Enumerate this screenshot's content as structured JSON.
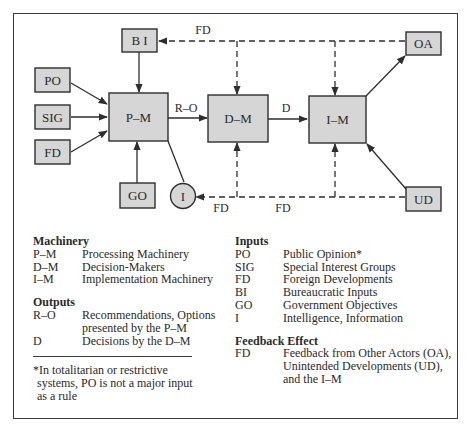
{
  "diagram": {
    "nodes": {
      "bi": "B I",
      "po": "PO",
      "sig": "SIG",
      "fd": "FD",
      "pm": "P–M",
      "go": "GO",
      "i": "I",
      "dm": "D–M",
      "im": "I–M",
      "oa": "OA",
      "ud": "UD"
    },
    "edge_labels": {
      "ro": "R–O",
      "d": "D",
      "fd_top": "FD",
      "fd_bottom_left": "FD",
      "fd_bottom_right": "FD"
    },
    "colors": {
      "box_fill": "#d6d6d6",
      "stroke": "#2e2e2e",
      "background": "#ffffff"
    }
  },
  "legend": {
    "machinery": {
      "title": "Machinery",
      "items": [
        {
          "code": "P–M",
          "desc": "Processing Machinery"
        },
        {
          "code": "D–M",
          "desc": "Decision-Makers"
        },
        {
          "code": "I–M",
          "desc": "Implementation Machinery"
        }
      ]
    },
    "outputs": {
      "title": "Outputs",
      "items": [
        {
          "code": "R–O",
          "desc": "Recommendations, Options",
          "desc2": "presented by the P–M"
        },
        {
          "code": "D",
          "desc": "Decisions by the D–M"
        }
      ]
    },
    "inputs": {
      "title": "Inputs",
      "items": [
        {
          "code": "PO",
          "desc": "Public Opinion*"
        },
        {
          "code": "SIG",
          "desc": "Special Interest Groups"
        },
        {
          "code": "FD",
          "desc": "Foreign Developments"
        },
        {
          "code": "BI",
          "desc": "Bureaucratic Inputs"
        },
        {
          "code": "GO",
          "desc": "Government Objectives"
        },
        {
          "code": "I",
          "desc": "Intelligence, Information"
        }
      ]
    },
    "feedback": {
      "title": "Feedback Effect",
      "items": [
        {
          "code": "FD",
          "desc": "Feedback from Other Actors (OA),",
          "desc2": "Unintended Developments (UD),",
          "desc3": "and the I–M"
        }
      ]
    },
    "footnote": {
      "line1": "*In totalitarian or restrictive",
      "line2": "systems, PO is not a major input",
      "line3": "as a rule"
    }
  }
}
